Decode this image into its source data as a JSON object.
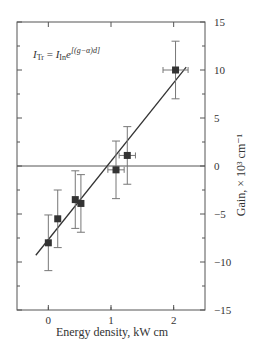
{
  "chart_data": {
    "type": "scatter",
    "title": "",
    "xlabel": "Energy density, kW cm",
    "ylabel": "Gain, × 10³ cm⁻¹",
    "annotation": "I_Tr = I_In e^[(g−α)d]",
    "annotation_parts": {
      "lhs": "I",
      "lhs_sub": "Tr",
      "eq": " = ",
      "rhs": "I",
      "rhs_sub": "In",
      "e": "e",
      "exp": "[(g−α)d]"
    },
    "xlim": [
      -0.5,
      2.5
    ],
    "ylim": [
      -15,
      15
    ],
    "xticks": [
      0,
      1,
      2
    ],
    "yticks": [
      15,
      10,
      5,
      0,
      -5,
      -10,
      -15
    ],
    "y_axis_side": "right",
    "zero_line": true,
    "points": [
      {
        "x": 0.0,
        "y": -8.0,
        "xerr": 0.0,
        "yerr": 2.9
      },
      {
        "x": 0.15,
        "y": -5.5,
        "xerr": 0.0,
        "yerr": 3.0
      },
      {
        "x": 0.43,
        "y": -3.5,
        "xerr": 0.0,
        "yerr": 3.0
      },
      {
        "x": 0.52,
        "y": -3.9,
        "xerr": 0.0,
        "yerr": 3.0
      },
      {
        "x": 1.08,
        "y": -0.4,
        "xerr": 0.13,
        "yerr": 3.0
      },
      {
        "x": 1.26,
        "y": 1.1,
        "xerr": 0.13,
        "yerr": 3.0
      },
      {
        "x": 2.03,
        "y": 10.0,
        "xerr": 0.2,
        "yerr": 3.0
      }
    ],
    "fit_line": {
      "x": [
        -0.2,
        2.2
      ],
      "y": [
        -9.3,
        10.3
      ]
    }
  }
}
